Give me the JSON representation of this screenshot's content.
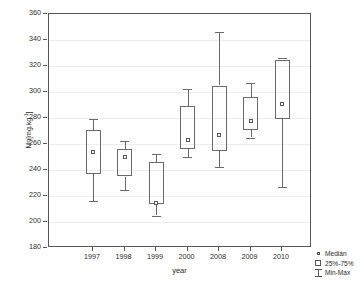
{
  "chart_data": {
    "type": "box",
    "title": "",
    "xlabel": "year",
    "ylabel": "Mn[mg.kg-1]",
    "ylabel_base": "Mn",
    "ylabel_units": "[mg.kg",
    "ylabel_exp": "-1",
    "ylabel_units_close": "]",
    "categories": [
      "1997",
      "1998",
      "1999",
      "2000",
      "2008",
      "2009",
      "2010"
    ],
    "ylim": [
      180,
      360
    ],
    "yticks": [
      180,
      200,
      220,
      240,
      260,
      280,
      300,
      320,
      340,
      360
    ],
    "ytick_labels": [
      "180",
      "200",
      "220",
      "240",
      "260",
      "280",
      "300",
      "320",
      "340",
      "360"
    ],
    "grid": true,
    "legend_position": "outside-bottom-right",
    "boxes": [
      {
        "category": "1997",
        "min": 216,
        "q1": 237,
        "median": 254,
        "q3": 271,
        "max": 279
      },
      {
        "category": "1998",
        "min": 225,
        "q1": 235,
        "median": 250,
        "q3": 256,
        "max": 262
      },
      {
        "category": "1999",
        "min": 205,
        "q1": 214,
        "median": 215,
        "q3": 246,
        "max": 252
      },
      {
        "category": "2000",
        "min": 250,
        "q1": 256,
        "median": 263,
        "q3": 289,
        "max": 302
      },
      {
        "category": "2008",
        "min": 242,
        "q1": 255,
        "median": 267,
        "q3": 305,
        "max": 346
      },
      {
        "category": "2009",
        "min": 265,
        "q1": 271,
        "median": 278,
        "q3": 296,
        "max": 307
      },
      {
        "category": "2010",
        "min": 227,
        "q1": 279,
        "median": 291,
        "q3": 325,
        "max": 326
      }
    ],
    "legend": [
      {
        "symbol": "median-point",
        "label": "Medián"
      },
      {
        "symbol": "box-range",
        "label": "25%-75%"
      },
      {
        "symbol": "whisker-range",
        "label": "Min-Max"
      }
    ],
    "colors": {
      "frame": "#555555",
      "grid": "#ededed",
      "box_stroke": "#6a6a6a",
      "text": "#2b2b2b",
      "background": "#ffffff"
    }
  }
}
